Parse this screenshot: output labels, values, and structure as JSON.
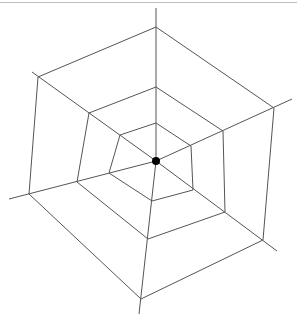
{
  "diagram": {
    "type": "spider-web",
    "center": {
      "x": 156,
      "y": 161,
      "dot_radius": 4
    },
    "colors": {
      "line": "#555555",
      "dot": "#000000",
      "background": "#ffffff",
      "top_rule": "#bdbdbd"
    },
    "spokes": [
      {
        "name": "top",
        "end": [
          156,
          8
        ]
      },
      {
        "name": "right-upper",
        "end": [
          292,
          99
        ]
      },
      {
        "name": "right-lower",
        "end": [
          277,
          251
        ]
      },
      {
        "name": "bottom",
        "end": [
          139,
          314
        ]
      },
      {
        "name": "left-lower",
        "end": [
          9,
          199
        ]
      },
      {
        "name": "left-upper",
        "end": [
          32,
          72
        ]
      }
    ],
    "rings": [
      {
        "name": "inner",
        "points": [
          [
            156,
            123
          ],
          [
            191,
            146
          ],
          [
            193,
            190
          ],
          [
            152,
            201
          ],
          [
            109,
            173
          ],
          [
            120,
            135
          ]
        ]
      },
      {
        "name": "middle",
        "points": [
          [
            156,
            87
          ],
          [
            223,
            131
          ],
          [
            225,
            212
          ],
          [
            148,
            239
          ],
          [
            77,
            182
          ],
          [
            89,
            113
          ]
        ]
      },
      {
        "name": "outer",
        "points": [
          [
            156,
            27
          ],
          [
            274,
            108
          ],
          [
            263,
            240
          ],
          [
            141,
            299
          ],
          [
            29,
            194
          ],
          [
            38,
            77
          ]
        ]
      }
    ]
  }
}
